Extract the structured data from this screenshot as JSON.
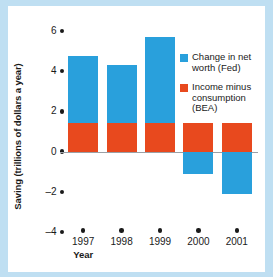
{
  "chart_data": {
    "type": "bar",
    "subtype": "stacked-bar-with-negative-values",
    "title": "",
    "xlabel": "Year",
    "ylabel": "Saving (trillions of dollars a year)",
    "categories": [
      "1997",
      "1998",
      "1999",
      "2000",
      "2001"
    ],
    "ylim": [
      -4,
      6
    ],
    "yticks": [
      "6",
      "4",
      "2",
      "0",
      "-2",
      "-4"
    ],
    "ytick_values": [
      6,
      4,
      2,
      0,
      -2,
      -4
    ],
    "grid": false,
    "legend_position": "upper-right",
    "zero_baseline": true,
    "series": [
      {
        "name": "Change in net worth (Fed)",
        "color": "#29a0dc",
        "values": [
          3.35,
          2.9,
          4.3,
          -1.1,
          -2.1
        ],
        "stack_totals": [
          4.75,
          4.3,
          5.7,
          -1.1,
          -2.1
        ]
      },
      {
        "name": "Income minus consumption (BEA)",
        "color": "#e8491e",
        "values": [
          1.4,
          1.4,
          1.4,
          1.4,
          1.4
        ]
      }
    ]
  },
  "legend": {
    "entries": [
      {
        "label": "Change in net\nworth (Fed)",
        "line1": "Change in net",
        "line2": "worth (Fed)",
        "color": "#29a0dc"
      },
      {
        "label": "Income minus consumption (BEA)",
        "line1": "Income minus",
        "line2": "consumption",
        "line3": "(BEA)",
        "color": "#e8491e"
      }
    ]
  },
  "colors": {
    "page_background": "#bfdff2",
    "plot_background": "#ffffff",
    "series_blue": "#29a0dc",
    "series_orange": "#e8491e",
    "axis_text": "#1a1a1a",
    "zero_line": "#9aa0a6"
  }
}
